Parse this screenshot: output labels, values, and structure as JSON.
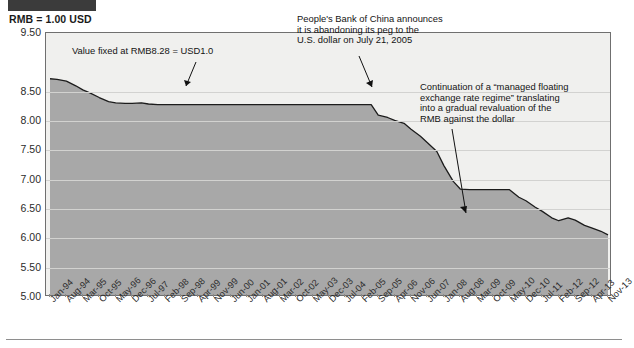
{
  "figure": {
    "unit_caption": "RMB = 1.00 USD",
    "redaction_bar": "redacted-title-block"
  },
  "annotations": {
    "peg": "Value fixed at RMB8.28 = USD1.0",
    "pbc": "People's Bank of China announces\nit is abandoning its peg to the\nU.S. dollar on July 21, 2005",
    "float": "Continuation of  a “managed floating\nexchange rate regime” translating\ninto a gradual revaluation of the\nRMB against the dollar"
  },
  "chart_data": {
    "type": "area",
    "title": "RMB = 1.00 USD",
    "xlabel": "",
    "ylabel": "RMB = 1.00 USD",
    "ylim": [
      5.0,
      9.5
    ],
    "grid": true,
    "legend": false,
    "ytick_labels": [
      "9.50",
      "8.50",
      "8.00",
      "7.50",
      "7.00",
      "6.50",
      "6.00",
      "5.50",
      "5.00"
    ],
    "ytick_values": [
      9.5,
      8.5,
      8.0,
      7.5,
      7.0,
      6.5,
      6.0,
      5.5,
      5.0
    ],
    "xtick_labels": [
      "Jan-94",
      "Aug-94",
      "Mar-95",
      "Oct-95",
      "May-96",
      "Dec-96",
      "Jul-97",
      "Feb-98",
      "Sep-98",
      "Apr-99",
      "Nov-99",
      "Jun-00",
      "Jan-01",
      "Aug-01",
      "Mar-02",
      "Oct-02",
      "May-03",
      "Dec-03",
      "Jul-04",
      "Feb-05",
      "Sep-05",
      "Apr-06",
      "Nov-06",
      "Jun-07",
      "Jan-08",
      "Aug-08",
      "Mar-09",
      "Oct-09",
      "May-10",
      "Dec-10",
      "Jul-11",
      "Feb-12",
      "Sep-12",
      "Apr-13",
      "Nov-13"
    ],
    "series": [
      {
        "name": "RMB per USD",
        "x": [
          "Jan-94",
          "Apr-94",
          "Aug-94",
          "Dec-94",
          "Mar-95",
          "Jun-95",
          "Oct-95",
          "Feb-96",
          "May-96",
          "Sep-96",
          "Dec-96",
          "Apr-97",
          "Jul-97",
          "Nov-97",
          "Feb-98",
          "Jun-98",
          "Sep-98",
          "Jan-99",
          "Apr-99",
          "Aug-99",
          "Nov-99",
          "Mar-00",
          "Jun-00",
          "Oct-00",
          "Jan-01",
          "May-01",
          "Aug-01",
          "Dec-01",
          "Mar-02",
          "Jul-02",
          "Oct-02",
          "Feb-03",
          "May-03",
          "Sep-03",
          "Dec-03",
          "Apr-04",
          "Jul-04",
          "Nov-04",
          "Feb-05",
          "Jun-05",
          "Sep-05",
          "Jan-06",
          "Apr-06",
          "Aug-06",
          "Nov-06",
          "Mar-07",
          "Jun-07",
          "Oct-07",
          "Jan-08",
          "May-08",
          "Aug-08",
          "Dec-08",
          "Mar-09",
          "Jul-09",
          "Oct-09",
          "Feb-10",
          "May-10",
          "Sep-10",
          "Dec-10",
          "Apr-11",
          "Jul-11",
          "Nov-11",
          "Feb-12",
          "Jun-12",
          "Sep-12",
          "Jan-13",
          "Apr-13",
          "Aug-13",
          "Nov-13"
        ],
        "values": [
          8.72,
          8.71,
          8.68,
          8.6,
          8.53,
          8.48,
          8.4,
          8.33,
          8.31,
          8.3,
          8.3,
          8.31,
          8.29,
          8.28,
          8.28,
          8.28,
          8.28,
          8.28,
          8.28,
          8.28,
          8.28,
          8.28,
          8.28,
          8.28,
          8.28,
          8.28,
          8.28,
          8.28,
          8.28,
          8.28,
          8.28,
          8.28,
          8.28,
          8.28,
          8.28,
          8.28,
          8.28,
          8.28,
          8.28,
          8.28,
          8.1,
          8.06,
          8.01,
          7.96,
          7.86,
          7.74,
          7.63,
          7.48,
          7.24,
          6.97,
          6.84,
          6.83,
          6.83,
          6.83,
          6.83,
          6.83,
          6.83,
          6.7,
          6.64,
          6.53,
          6.46,
          6.35,
          6.3,
          6.35,
          6.31,
          6.22,
          6.18,
          6.12,
          6.06
        ]
      }
    ],
    "annotations": [
      {
        "text": "Value fixed at RMB8.28 = USD1.0",
        "points_to": "Jul-04",
        "value": 8.28
      },
      {
        "text": "People's Bank of China announces it is abandoning its peg to the U.S. dollar on July 21, 2005",
        "points_to": "Jul-05",
        "value": 8.28
      },
      {
        "text": "Continuation of a “managed floating exchange rate regime” translating into a gradual revaluation of the RMB against the dollar",
        "points_to": "Feb-12",
        "value": 6.3
      }
    ]
  }
}
